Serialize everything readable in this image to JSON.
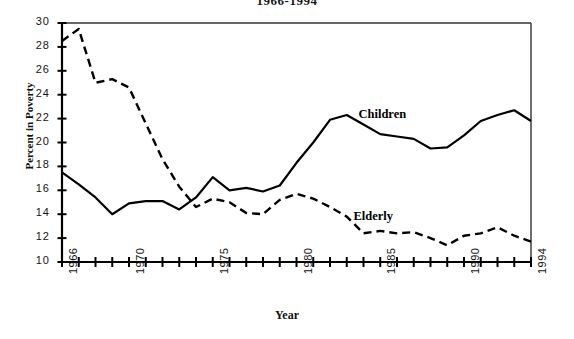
{
  "chart_data": {
    "type": "line",
    "title": "1966-1994",
    "xlabel": "Year",
    "ylabel": "Percent in Poverty",
    "xlim": [
      1966,
      1994
    ],
    "ylim": [
      10,
      30
    ],
    "yticks": [
      10,
      12,
      14,
      16,
      18,
      20,
      22,
      24,
      26,
      28,
      30
    ],
    "xticks": [
      1966,
      1970,
      1975,
      1980,
      1985,
      1990,
      1994
    ],
    "xtick_labels": [
      "1966",
      "1970",
      "1975",
      "1980",
      "1985",
      "1990",
      "1994"
    ],
    "ytick_labels": [
      "10",
      "12",
      "14",
      "16",
      "18",
      "20",
      "22",
      "24",
      "26",
      "28",
      "30"
    ],
    "grid": false,
    "legend_position": "inline-annotations",
    "x": [
      1966,
      1967,
      1968,
      1969,
      1970,
      1971,
      1972,
      1973,
      1974,
      1975,
      1976,
      1977,
      1978,
      1979,
      1980,
      1981,
      1982,
      1983,
      1984,
      1985,
      1986,
      1987,
      1988,
      1989,
      1990,
      1991,
      1992,
      1993,
      1994
    ],
    "series": [
      {
        "name": "Children",
        "style": "solid",
        "color": "#000000",
        "values": [
          17.5,
          16.5,
          15.4,
          14.0,
          14.9,
          15.1,
          15.1,
          14.4,
          15.4,
          17.1,
          16.0,
          16.2,
          15.9,
          16.4,
          18.3,
          20.0,
          21.9,
          22.3,
          21.5,
          20.7,
          20.5,
          20.3,
          19.5,
          19.6,
          20.6,
          21.8,
          22.3,
          22.7,
          21.8
        ]
      },
      {
        "name": "Elderly",
        "style": "dashed",
        "color": "#000000",
        "values": [
          28.5,
          29.5,
          25.0,
          25.3,
          24.6,
          21.6,
          18.6,
          16.3,
          14.6,
          15.3,
          15.0,
          14.1,
          14.0,
          15.2,
          15.7,
          15.3,
          14.6,
          13.8,
          12.4,
          12.6,
          12.4,
          12.5,
          12.0,
          11.4,
          12.2,
          12.4,
          12.9,
          12.2,
          11.7
        ]
      }
    ],
    "annotations": [
      {
        "text": "Children",
        "x": 1983.7,
        "y": 22.2
      },
      {
        "text": "Elderly",
        "x": 1983.4,
        "y": 13.7
      }
    ]
  }
}
